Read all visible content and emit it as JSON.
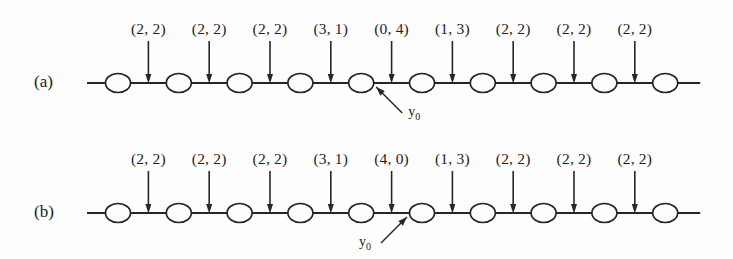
{
  "figure": {
    "background_color": "#fdfdfd",
    "ink_color": "#262626",
    "node_count": 10,
    "panels": [
      {
        "id": "a",
        "label": "(a)",
        "edge_labels": [
          "(2, 2)",
          "(2, 2)",
          "(2, 2)",
          "(3, 1)",
          "(0, 4)",
          "(1, 3)",
          "(2, 2)",
          "(2, 2)",
          "(2, 2)"
        ],
        "marker": {
          "text": "y",
          "subscript": "0",
          "target_node_index": 4,
          "leader_direction": "up-left"
        }
      },
      {
        "id": "b",
        "label": "(b)",
        "edge_labels": [
          "(2, 2)",
          "(2, 2)",
          "(2, 2)",
          "(3, 1)",
          "(4, 0)",
          "(1, 3)",
          "(2, 2)",
          "(2, 2)",
          "(2, 2)"
        ],
        "marker": {
          "text": "y",
          "subscript": "0",
          "target_node_index": 5,
          "leader_direction": "up-right"
        }
      }
    ]
  }
}
